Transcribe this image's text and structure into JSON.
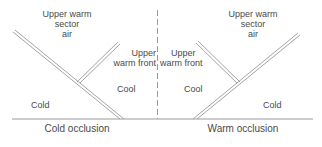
{
  "diagram": {
    "type": "occluded-front-cross-section",
    "colors": {
      "line": "#9a9a9a",
      "text": "#4a4a4a",
      "background": "#ffffff"
    },
    "left_panel": {
      "upper_air_label": [
        "Upper warm",
        "sector",
        "air"
      ],
      "upper_front_label": [
        "Upper",
        "warm front"
      ],
      "cool_label": "Cool",
      "cold_label": "Cold",
      "caption": "Cold occlusion"
    },
    "right_panel": {
      "upper_air_label": [
        "Upper warm",
        "sector",
        "air"
      ],
      "upper_front_label": [
        "Upper",
        "warm front"
      ],
      "cool_label": "Cool",
      "cold_label": "Cold",
      "caption": "Warm occlusion"
    }
  }
}
